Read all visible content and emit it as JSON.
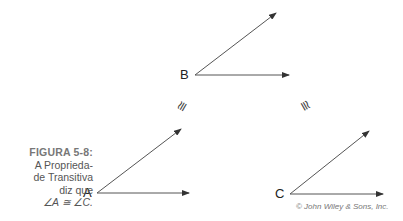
{
  "figure": {
    "caption_title": "FIGURA 5-8:",
    "caption_line1": "A Proprieda-",
    "caption_line2": "de Transitiva",
    "caption_line3": "diz que",
    "caption_statement": "∠A ≅ ∠C.",
    "credit": "© John Wiley & Sons, Inc."
  },
  "angles": [
    {
      "label": "B",
      "vertex": [
        195,
        75
      ],
      "ray1_tip": [
        290,
        75
      ],
      "ray2_tip": [
        277,
        12
      ]
    },
    {
      "label": "A",
      "vertex": [
        97,
        193
      ],
      "ray1_tip": [
        190,
        193
      ],
      "ray2_tip": [
        182,
        128
      ]
    },
    {
      "label": "C",
      "vertex": [
        290,
        194
      ],
      "ray1_tip": [
        384,
        194
      ],
      "ray2_tip": [
        370,
        130
      ]
    }
  ],
  "congruence_symbols": [
    {
      "symbol": "≅",
      "position": "between B and A"
    },
    {
      "symbol": "≅",
      "position": "between B and C"
    }
  ],
  "colors": {
    "line": "#444444",
    "text": "#222222",
    "caption": "#555555"
  }
}
